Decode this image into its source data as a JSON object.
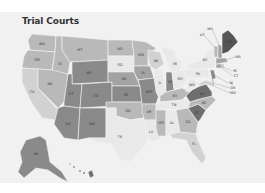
{
  "title": "Trial Courts",
  "colors": {
    "c1": "#e9e9e9",
    "c2": "#d2d2d2",
    "c3": "#b9b9b9",
    "c4": "#a3a3a3",
    "c5": "#8a8a8a",
    "c6": "#6e6e6e",
    "c7": "#555555"
  },
  "states": [
    {
      "id": "WA",
      "label": "WA",
      "shade": "c3",
      "points": "32,22 56,24 55,40 30,38 28,28",
      "lx": 42,
      "ly": 32
    },
    {
      "id": "OR",
      "label": "OR",
      "shade": "c3",
      "points": "28,38 55,40 52,58 22,56 24,44",
      "lx": 37,
      "ly": 48
    },
    {
      "id": "CA",
      "label": "CA",
      "shade": "c2",
      "points": "22,56 38,57 38,76 58,98 55,108 42,106 30,88 22,70",
      "lx": 32,
      "ly": 80
    },
    {
      "id": "ID",
      "label": "ID",
      "shade": "c3",
      "points": "56,24 62,24 62,38 70,50 68,62 52,60 55,40",
      "lx": 60,
      "ly": 52
    },
    {
      "id": "NV",
      "label": "NV",
      "shade": "c3",
      "points": "38,57 52,58 68,62 64,90 58,96 38,76",
      "lx": 50,
      "ly": 72
    },
    {
      "id": "MT",
      "label": "MT",
      "shade": "c3",
      "points": "62,24 108,28 108,48 70,50 62,38",
      "lx": 80,
      "ly": 38
    },
    {
      "id": "WY",
      "label": "WY",
      "shade": "c5",
      "points": "72,50 108,48 108,70 72,72",
      "lx": 89,
      "ly": 61
    },
    {
      "id": "UT",
      "label": "UT",
      "shade": "c5",
      "points": "68,62 72,62 72,72 82,72 80,96 64,94 64,90",
      "lx": 71,
      "ly": 82
    },
    {
      "id": "CO",
      "label": "CO",
      "shade": "c5",
      "points": "82,72 112,70 112,94 80,96",
      "lx": 96,
      "ly": 84
    },
    {
      "id": "AZ",
      "label": "AZ",
      "shade": "c5",
      "points": "58,96 64,94 80,96 78,128 64,126 54,112 55,108",
      "lx": 68,
      "ly": 112
    },
    {
      "id": "NM",
      "label": "NM",
      "shade": "c5",
      "points": "80,96 106,96 106,126 88,126 78,128",
      "lx": 92,
      "ly": 112
    },
    {
      "id": "ND",
      "label": "ND",
      "shade": "c3",
      "points": "108,28 132,28 134,44 108,44",
      "lx": 120,
      "ly": 37
    },
    {
      "id": "SD",
      "label": "SD",
      "shade": "c1",
      "points": "108,44 134,44 134,60 108,60",
      "lx": 120,
      "ly": 53
    },
    {
      "id": "NE",
      "label": "NE",
      "shade": "c4",
      "points": "108,60 134,60 140,74 112,74 112,70 108,70",
      "lx": 124,
      "ly": 67
    },
    {
      "id": "KS",
      "label": "KS",
      "shade": "c5",
      "points": "112,74 140,74 142,90 112,90",
      "lx": 126,
      "ly": 83
    },
    {
      "id": "OK",
      "label": "OK",
      "shade": "c3",
      "points": "106,90 142,90 144,106 130,108 116,104 116,96 106,96",
      "lx": 128,
      "ly": 99
    },
    {
      "id": "TX",
      "label": "TX",
      "shade": "c1",
      "points": "106,96 116,96 116,104 130,108 144,106 150,118 146,132 130,150 120,148 112,132 96,130 88,126 106,126",
      "lx": 120,
      "ly": 125
    },
    {
      "id": "MN",
      "label": "MN",
      "shade": "c3",
      "points": "132,28 146,30 156,36 148,44 148,54 134,54 134,44",
      "lx": 141,
      "ly": 43
    },
    {
      "id": "IA",
      "label": "IA",
      "shade": "c4",
      "points": "134,54 150,54 154,66 138,68 134,60",
      "lx": 143,
      "ly": 61
    },
    {
      "id": "MO",
      "label": "MO",
      "shade": "c5",
      "points": "138,68 154,66 160,80 156,92 142,92 140,74",
      "lx": 149,
      "ly": 80
    },
    {
      "id": "AR",
      "label": "AR",
      "shade": "c3",
      "points": "142,92 156,92 156,108 144,108 144,106 142,100",
      "lx": 149,
      "ly": 100
    },
    {
      "id": "LA",
      "label": "LA",
      "shade": "c1",
      "points": "144,108 156,108 156,116 162,126 150,130 146,120",
      "lx": 151,
      "ly": 120
    },
    {
      "id": "WI",
      "label": "WI",
      "shade": "c2",
      "points": "148,38 160,40 164,52 156,58 150,54 148,46",
      "lx": 156,
      "ly": 49
    },
    {
      "id": "IL",
      "label": "IL",
      "shade": "c1",
      "points": "154,58 162,58 166,80 160,88 156,80 154,66",
      "lx": 160,
      "ly": 71
    },
    {
      "id": "MI",
      "label": "MI",
      "shade": "c1",
      "points": "160,34 174,38 176,46 182,50 180,60 170,60 166,46",
      "lx": 175,
      "ly": 52
    },
    {
      "id": "IN",
      "label": "IN",
      "shade": "c5",
      "points": "166,60 172,60 174,78 166,80",
      "lx": 170,
      "ly": 70
    },
    {
      "id": "OH",
      "label": "OH",
      "shade": "c1",
      "points": "172,60 184,58 188,68 182,76 174,76",
      "lx": 180,
      "ly": 67
    },
    {
      "id": "KY",
      "label": "KY",
      "shade": "c3",
      "points": "160,84 166,80 174,78 182,76 190,80 182,88 160,90",
      "lx": 175,
      "ly": 84
    },
    {
      "id": "TN",
      "label": "TN",
      "shade": "c1",
      "points": "156,92 160,90 182,88 196,88 190,96 156,98",
      "lx": 174,
      "ly": 93
    },
    {
      "id": "MS",
      "label": "MS",
      "shade": "c3",
      "points": "156,98 166,98 166,124 158,124 156,116",
      "lx": 161,
      "ly": 111
    },
    {
      "id": "AL",
      "label": "AL",
      "shade": "c1",
      "points": "166,98 176,98 180,120 170,122 168,126 166,124",
      "lx": 172,
      "ly": 111
    },
    {
      "id": "GA",
      "label": "GA",
      "shade": "c3",
      "points": "176,98 188,96 198,110 196,122 180,120",
      "lx": 188,
      "ly": 110
    },
    {
      "id": "FL",
      "label": "FL",
      "shade": "c2",
      "points": "170,122 180,120 196,122 198,128 206,146 202,152 192,140 186,128 172,126",
      "lx": 194,
      "ly": 132
    },
    {
      "id": "SC",
      "label": "SC",
      "shade": "c6",
      "points": "188,96 198,92 206,98 200,108 198,110",
      "lx": 197,
      "ly": 101
    },
    {
      "id": "NC",
      "label": "NC",
      "shade": "c3",
      "points": "190,90 196,88 212,84 216,88 208,96 206,98 198,92 188,96",
      "lx": 204,
      "ly": 91
    },
    {
      "id": "VA",
      "label": "VA",
      "shade": "c6",
      "points": "186,84 192,78 200,74 206,72 212,80 212,84 196,88 190,90",
      "lx": 202,
      "ly": 82
    },
    {
      "id": "WV",
      "label": "WV",
      "shade": "c1",
      "points": "188,68 194,66 198,72 192,78 186,80",
      "lx": 192,
      "ly": 73
    },
    {
      "id": "PA",
      "label": "PA",
      "shade": "c1",
      "points": "184,58 208,56 210,66 194,66 188,68",
      "lx": 198,
      "ly": 62
    },
    {
      "id": "NY",
      "label": "NY",
      "shade": "c1",
      "points": "188,52 202,48 208,38 214,36 216,52 214,56 208,56 188,58",
      "lx": 205,
      "ly": 48
    },
    {
      "id": "MD",
      "label": "MD",
      "shade": "c2",
      "points": "198,72 206,68 212,70 212,74 206,72 200,74",
      "lx": 206,
      "ly": 72
    },
    {
      "id": "DE",
      "label": "DE",
      "shade": "c3",
      "points": "212,68 214,68 214,74 212,74",
      "lx": 213,
      "ly": 71
    },
    {
      "id": "NJ",
      "label": "NJ",
      "shade": "c5",
      "points": "210,58 214,58 216,66 212,68",
      "lx": 213,
      "ly": 62
    },
    {
      "id": "CT",
      "label": "CT",
      "shade": "c4",
      "points": "216,52 222,52 222,56 216,56",
      "lx": 219,
      "ly": 54
    },
    {
      "id": "RI",
      "label": "RI",
      "shade": "c3",
      "points": "222,52 224,52 224,56 222,56",
      "lx": 223,
      "ly": 54
    },
    {
      "id": "MA",
      "label": "MA",
      "shade": "c4",
      "points": "216,46 226,46 228,50 216,52",
      "lx": 221,
      "ly": 49
    },
    {
      "id": "VT",
      "label": "VT",
      "shade": "c3",
      "points": "214,34 218,34 218,44 216,46 214,44",
      "lx": 216,
      "ly": 40
    },
    {
      "id": "NH",
      "label": "NH",
      "shade": "c4",
      "points": "218,32 222,34 222,46 218,46",
      "lx": 220,
      "ly": 40
    },
    {
      "id": "ME",
      "label": "ME",
      "shade": "c7",
      "points": "222,22 228,18 234,24 238,30 228,40 222,42",
      "lx": 230,
      "ly": 30
    },
    {
      "id": "AK",
      "label": "AK",
      "shade": "c5",
      "points": "26,128 40,124 46,128 50,150 62,160 68,170 60,166 48,158 36,156 24,166 18,160 22,150 20,140",
      "lx": 36,
      "ly": 142
    },
    {
      "id": "HI",
      "label": "HI",
      "shade": "c6",
      "points": "88,160 92,158 94,164 90,166",
      "lx": 0,
      "ly": 0
    }
  ],
  "outside_labels": [
    {
      "text": "NH",
      "x": 212,
      "y": 17,
      "lineTo": [
        219,
        33
      ]
    },
    {
      "text": "VT",
      "x": 204,
      "y": 23,
      "lineTo": [
        215,
        36
      ]
    },
    {
      "text": "MA",
      "x": 235,
      "y": 45,
      "lineTo": [
        226,
        48
      ]
    },
    {
      "text": "RI",
      "x": 232,
      "y": 59,
      "lineTo": [
        223,
        55
      ]
    },
    {
      "text": "CT",
      "x": 233,
      "y": 64,
      "lineTo": [
        220,
        55
      ]
    },
    {
      "text": "NJ",
      "x": 228,
      "y": 71,
      "lineTo": [
        214,
        63
      ]
    },
    {
      "text": "DE",
      "x": 230,
      "y": 76,
      "lineTo": [
        213,
        71
      ]
    },
    {
      "text": "MD",
      "x": 230,
      "y": 81,
      "lineTo": [
        209,
        72
      ]
    }
  ],
  "hawaii_dots": [
    {
      "x": 70,
      "y": 152,
      "r": 0.7
    },
    {
      "x": 74,
      "y": 155,
      "r": 0.9
    },
    {
      "x": 80,
      "y": 159,
      "r": 0.9
    },
    {
      "x": 84,
      "y": 161,
      "r": 1.0
    }
  ]
}
